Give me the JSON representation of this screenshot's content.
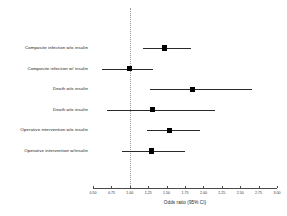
{
  "chart_data": {
    "type": "forest",
    "title": "",
    "xlabel": "Odds ratio (95% CI)",
    "ylabel": "",
    "xlim": [
      0.5,
      3.0
    ],
    "xticks": [
      0.5,
      0.75,
      1.0,
      1.25,
      1.5,
      1.75,
      2.0,
      2.25,
      2.5,
      2.75,
      3.0
    ],
    "xtick_labels": [
      "0.50",
      "0.75",
      "1.00",
      "1.25",
      "1.50",
      "1.75",
      "2.00",
      "2.25",
      "2.50",
      "2.75",
      "3.00"
    ],
    "reference_line": 1.0,
    "grid": false,
    "legend": "none",
    "categories": [
      "Composite infection w/o insulin",
      "Composite infection w/ insulin",
      "Death w/o insulin",
      "Death w/o insulin",
      "Operative intervention w/o insulin",
      "Operative intervention w/insulin"
    ],
    "points": [
      {
        "label": "Composite infection w/o insulin",
        "or": 1.47,
        "lower": 1.18,
        "upper": 1.83
      },
      {
        "label": "Composite infection w/ insulin",
        "or": 1.0,
        "lower": 0.62,
        "upper": 1.31
      },
      {
        "label": "Death w/o insulin",
        "or": 1.85,
        "lower": 1.27,
        "upper": 2.66
      },
      {
        "label": "Death w/o insulin",
        "or": 1.31,
        "lower": 0.69,
        "upper": 2.16
      },
      {
        "label": "Operative intervention w/o insulin",
        "or": 1.54,
        "lower": 1.24,
        "upper": 1.96
      },
      {
        "label": "Operative intervention w/insulin",
        "or": 1.29,
        "lower": 0.9,
        "upper": 1.75
      }
    ]
  },
  "colors": {
    "marker": "#000000",
    "ci": "#2a2a2a",
    "axis": "#4a4a4a",
    "reference": "#999999",
    "background": "#ffffff"
  }
}
